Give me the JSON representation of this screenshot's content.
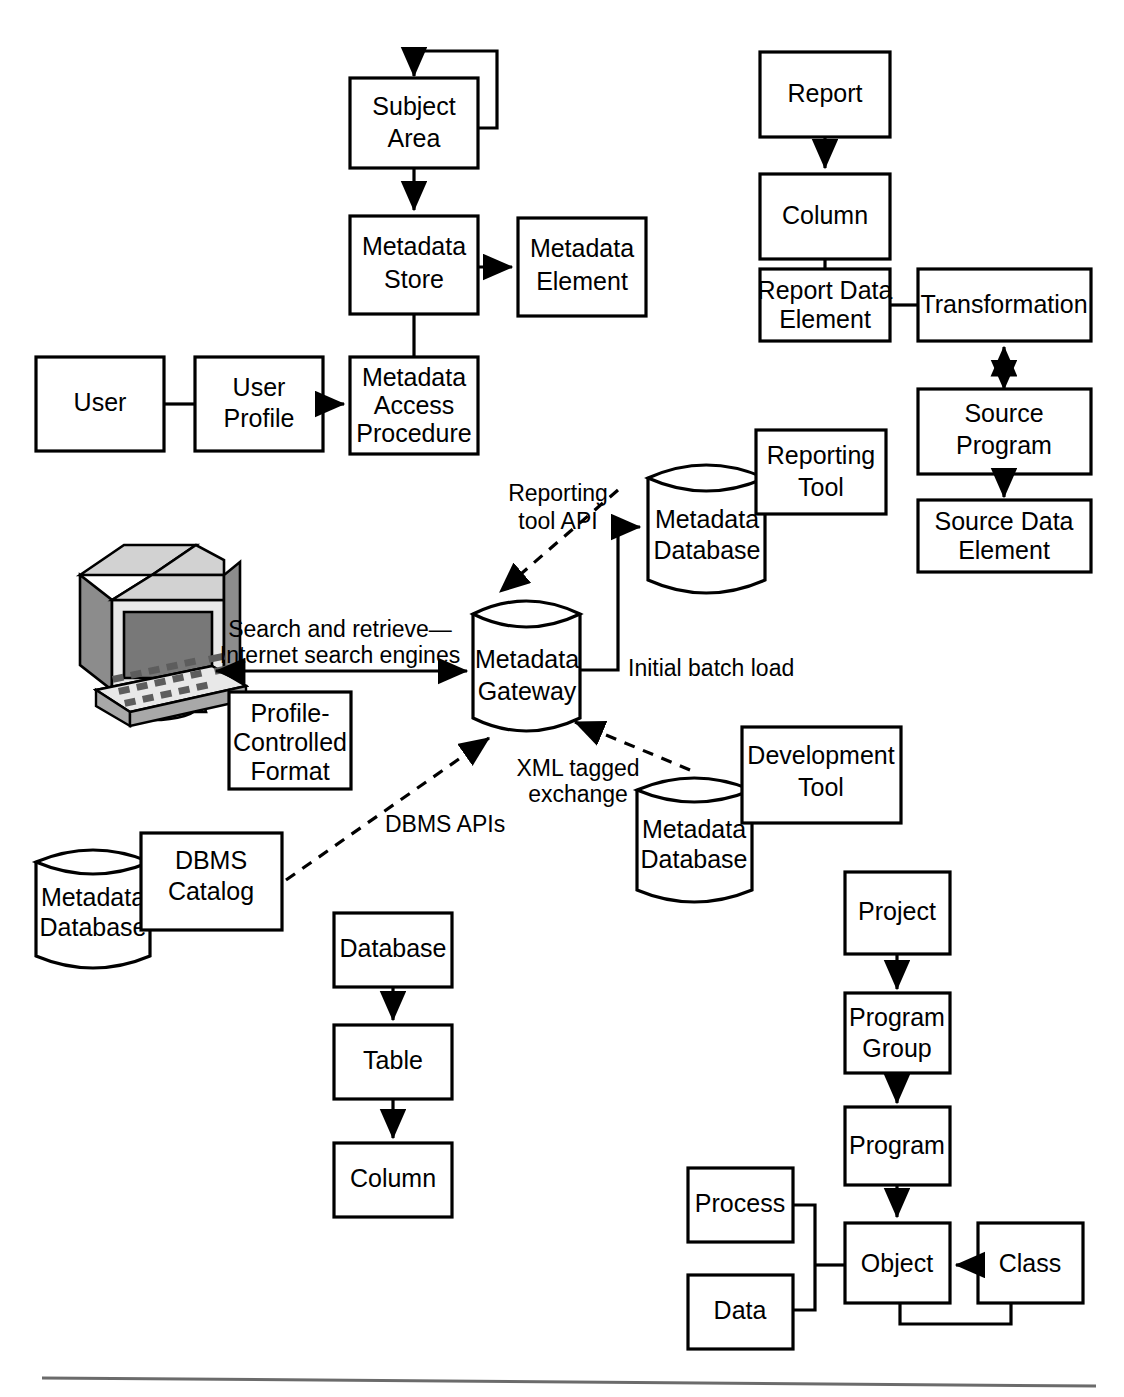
{
  "figure": {
    "stroke_color": "#000000",
    "background": "#ffffff",
    "rule_color": "#6b6b6b"
  },
  "boxes": {
    "subject_area": "Subject\nArea",
    "subject_area_l1": "Subject",
    "subject_area_l2": "Area",
    "metadata_store_l1": "Metadata",
    "metadata_store_l2": "Store",
    "metadata_element_l1": "Metadata",
    "metadata_element_l2": "Element",
    "user": "User",
    "user_profile_l1": "User",
    "user_profile_l2": "Profile",
    "metadata_access_l1": "Metadata",
    "metadata_access_l2": "Access",
    "metadata_access_l3": "Procedure",
    "report": "Report",
    "column_top": "Column",
    "report_data_element_l1": "Report Data",
    "report_data_element_l2": "Element",
    "transformation": "Transformation",
    "source_program_l1": "Source",
    "source_program_l2": "Program",
    "source_data_element_l1": "Source Data",
    "source_data_element_l2": "Element",
    "reporting_tool_l1": "Reporting",
    "reporting_tool_l2": "Tool",
    "development_tool_l1": "Development",
    "development_tool_l2": "Tool",
    "profile_controlled_l1": "Profile-",
    "profile_controlled_l2": "Controlled",
    "profile_controlled_l3": "Format",
    "dbms_catalog_l1": "DBMS",
    "dbms_catalog_l2": "Catalog",
    "database": "Database",
    "table": "Table",
    "column_bottom": "Column",
    "project": "Project",
    "program_group_l1": "Program",
    "program_group_l2": "Group",
    "program": "Program",
    "process": "Process",
    "data": "Data",
    "object": "Object",
    "class": "Class"
  },
  "cylinders": {
    "metadata_gateway_l1": "Metadata",
    "metadata_gateway_l2": "Gateway",
    "metadata_db_top_l1": "Metadata",
    "metadata_db_top_l2": "Database",
    "metadata_db_right_l1": "Metadata",
    "metadata_db_right_l2": "Database",
    "metadata_db_left_l1": "Metadata",
    "metadata_db_left_l2": "Database"
  },
  "edge_labels": {
    "reporting_tool_api_l1": "Reporting",
    "reporting_tool_api_l2": "tool API",
    "search_retrieve_l1": "Search and retrieve—",
    "search_retrieve_l2": "Internet search engines",
    "initial_batch_load": "Initial batch load",
    "xml_tagged_l1": "XML tagged",
    "xml_tagged_l2": "exchange",
    "dbms_apis": "DBMS APIs"
  },
  "icons": {
    "workstation": "computer-workstation-icon"
  }
}
